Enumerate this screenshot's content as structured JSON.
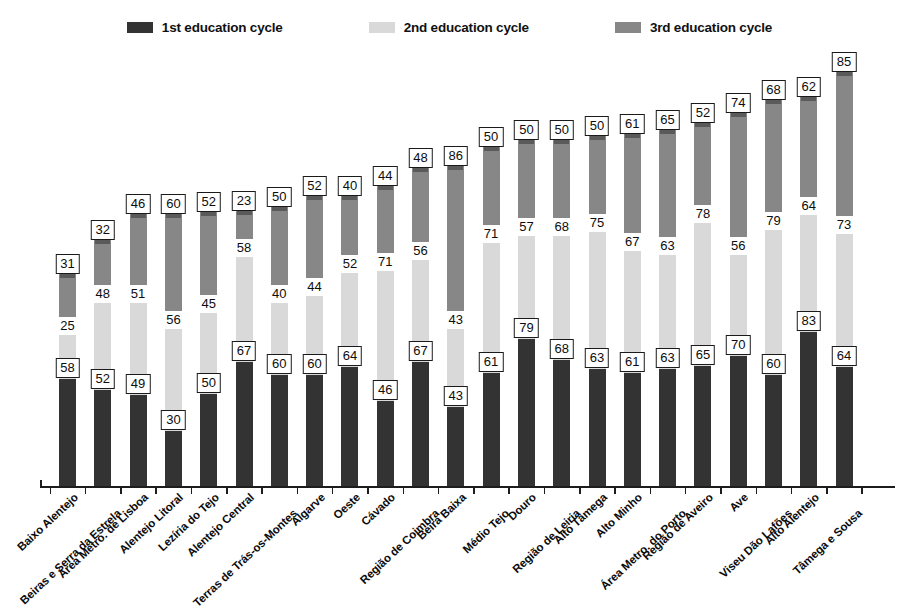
{
  "legend": {
    "items": [
      {
        "label": "1st education cycle",
        "color": "#333333",
        "key": "cycle1"
      },
      {
        "label": "2nd education cycle",
        "color": "#d9d9d9",
        "key": "cycle2"
      },
      {
        "label": "3rd education cycle",
        "color": "#878787",
        "key": "cycle3"
      }
    ]
  },
  "chart_data": {
    "type": "bar",
    "subtype": "stacked-column",
    "title": "",
    "xlabel": "",
    "ylabel": "",
    "grid": false,
    "legend_position": "top-center",
    "series": [
      {
        "name": "1st education cycle",
        "color": "#333333",
        "values": [
          58,
          52,
          49,
          30,
          50,
          67,
          60,
          60,
          64,
          46,
          67,
          43,
          61,
          79,
          68,
          63,
          61,
          63,
          65,
          70,
          60,
          83,
          64
        ]
      },
      {
        "name": "2nd education cycle",
        "color": "#d9d9d9",
        "values": [
          25,
          48,
          51,
          56,
          45,
          58,
          40,
          44,
          52,
          71,
          56,
          43,
          71,
          57,
          68,
          75,
          67,
          63,
          78,
          56,
          79,
          64,
          73
        ]
      },
      {
        "name": "3rd education cycle",
        "color": "#878787",
        "values": [
          31,
          32,
          46,
          60,
          52,
          23,
          50,
          52,
          40,
          44,
          48,
          86,
          50,
          50,
          50,
          50,
          61,
          65,
          52,
          74,
          68,
          62,
          85
        ]
      }
    ],
    "categories": [
      "Baixo Alentejo",
      "Beiras e Serra da Estrela",
      "Área Metro. de Lisboa",
      "Alentejo Litoral",
      "Lezíria do Tejo",
      "Alentejo Central",
      "Terras de Trás-os-Montes",
      "Algarve",
      "Oeste",
      "Cávado",
      "Região de Coimbra",
      "Beira Baixa",
      "Médio Tejo",
      "Douro",
      "Região de Leiria",
      "Alto Tâmega",
      "Alto Minho",
      "Área Metro. do Porto",
      "Região de Aveiro",
      "Ave",
      "Viseu Dão Lafões",
      "Alto Alentejo",
      "Tâmega e Sousa"
    ],
    "value_label_style": {
      "cycle1": "boxed",
      "cycle2": "plain",
      "cycle3": "boxed"
    }
  }
}
